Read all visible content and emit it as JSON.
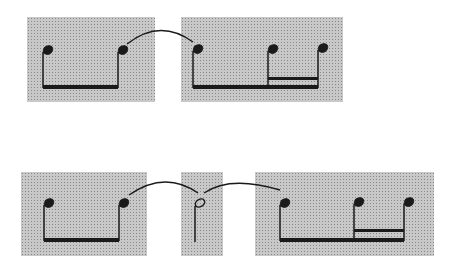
{
  "figure": {
    "colors": {
      "box_fill": "#c8c8c8",
      "ink": "#1a1a1a",
      "background": "#ffffff"
    },
    "rows": [
      {
        "name": "top-row",
        "boxes": [
          {
            "id": "box-1",
            "x": 27,
            "y": 17,
            "w": 128,
            "h": 85,
            "notes": 2,
            "beams": 1
          },
          {
            "id": "box-2",
            "x": 181,
            "y": 17,
            "w": 162,
            "h": 85,
            "notes": 3,
            "beams": 2
          }
        ],
        "ties": [
          {
            "from": "box-1",
            "to": "box-2"
          }
        ]
      },
      {
        "name": "bottom-row",
        "boxes": [
          {
            "id": "box-3",
            "x": 21,
            "y": 172,
            "w": 126,
            "h": 84,
            "notes": 2,
            "beams": 1
          },
          {
            "id": "box-4",
            "x": 181,
            "y": 172,
            "w": 42,
            "h": 84,
            "notes": 1,
            "beams": 0,
            "note_style": "open-head"
          },
          {
            "id": "box-5",
            "x": 255,
            "y": 172,
            "w": 179,
            "h": 84,
            "notes": 3,
            "beams": 2
          }
        ],
        "ties": [
          {
            "from": "box-3",
            "to": "box-4"
          },
          {
            "from": "box-4",
            "to": "box-5"
          }
        ]
      }
    ]
  }
}
